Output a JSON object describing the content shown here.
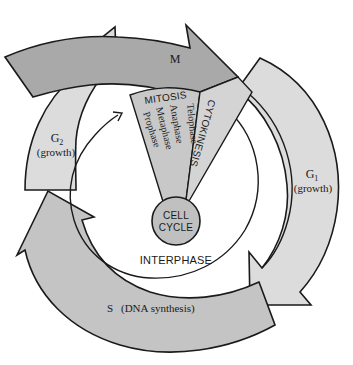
{
  "diagram": {
    "title": "Cell Cycle",
    "center": {
      "line1": "CELL",
      "line2": "CYCLE"
    },
    "interphase_label": "INTERPHASE",
    "phases": {
      "M": {
        "label": "M"
      },
      "G1": {
        "label": "G",
        "sub": "1",
        "note": "(growth)"
      },
      "G2": {
        "label": "G",
        "sub": "2",
        "note": "(growth)"
      },
      "S": {
        "label": "S",
        "note": "(DNA synthesis)"
      }
    },
    "mitosis": {
      "title": "MITOSIS",
      "stages": [
        "Prophase",
        "Metaphase",
        "Anaphase",
        "Telophase"
      ]
    },
    "cytokinesis": {
      "title": "CYTOKINESIS"
    },
    "colors": {
      "M_fill": "#a9a9a9",
      "G_fill": "#dcdcdc",
      "S_fill": "#c4c4c4",
      "wedge_fill": "#c8c8c8",
      "center_fill": "#c0c0c0",
      "stroke": "#1a1a1a",
      "background": "#ffffff"
    }
  }
}
